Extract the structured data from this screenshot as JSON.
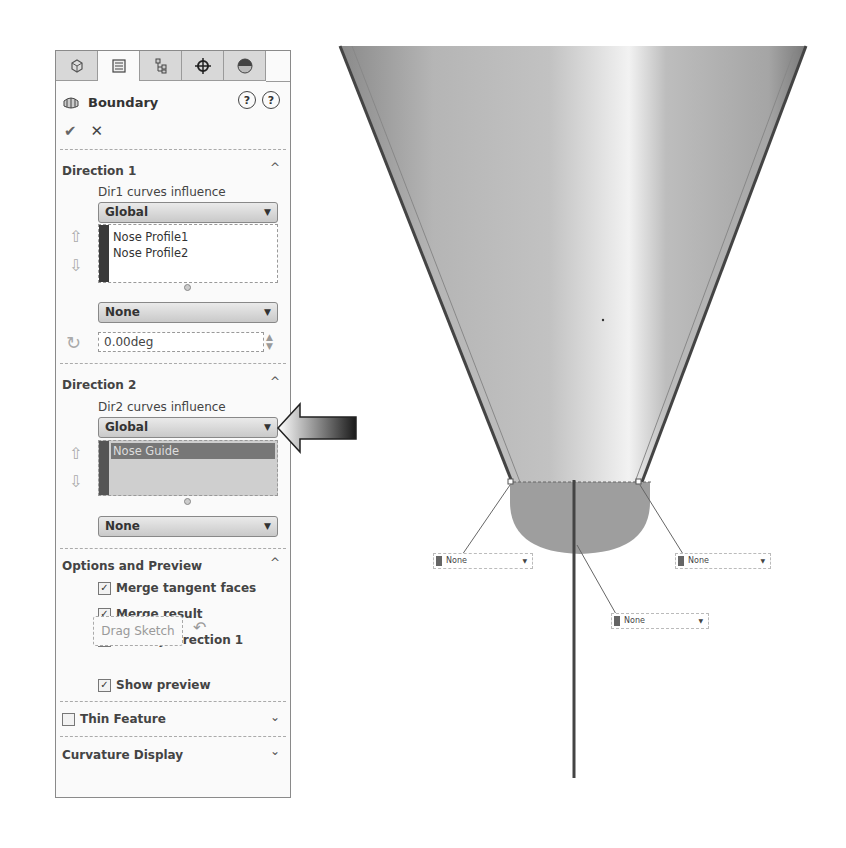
{
  "panel": {
    "tabs": [
      {
        "name": "feature-manager",
        "icon": "part-icon"
      },
      {
        "name": "property-manager",
        "icon": "property-list-icon",
        "active": true
      },
      {
        "name": "configuration-manager",
        "icon": "config-tree-icon"
      },
      {
        "name": "dimxpert-manager",
        "icon": "crosshair-icon"
      },
      {
        "name": "display-manager",
        "icon": "appearance-sphere-icon"
      }
    ],
    "title": "Boundary",
    "help_whats_new": "?",
    "help": "?",
    "ok_label": "✔",
    "cancel_label": "✕",
    "direction1": {
      "title": "Direction 1",
      "caret": "^",
      "influence_label": "Dir1 curves influence",
      "influence_value": "Global",
      "curves": [
        "Nose Profile1",
        "Nose Profile2"
      ],
      "tangency_value": "None",
      "angle_value": "0.00deg"
    },
    "direction2": {
      "title": "Direction 2",
      "caret": "^",
      "influence_label": "Dir2 curves influence",
      "influence_value": "Global",
      "curves": [
        "Nose Guide"
      ],
      "tangency_value": "None"
    },
    "options": {
      "title": "Options and Preview",
      "caret": "^",
      "merge_tangent": {
        "label": "Merge tangent faces",
        "checked": "✓"
      },
      "merge_result": {
        "label": "Merge result",
        "checked": "✓"
      },
      "trim": {
        "label": "Trim by direction 1",
        "checked": ""
      },
      "drag_sketch": "Drag Sketch",
      "show_preview": {
        "label": "Show preview",
        "checked": "✓"
      }
    },
    "thin_feature": {
      "title": "Thin Feature",
      "caret": "v"
    },
    "curvature_display": {
      "title": "Curvature Display",
      "caret": "v"
    }
  },
  "viewport": {
    "callouts": [
      {
        "label": "None",
        "position": "left"
      },
      {
        "label": "None",
        "position": "right"
      },
      {
        "label": "None",
        "position": "bottom"
      }
    ]
  }
}
